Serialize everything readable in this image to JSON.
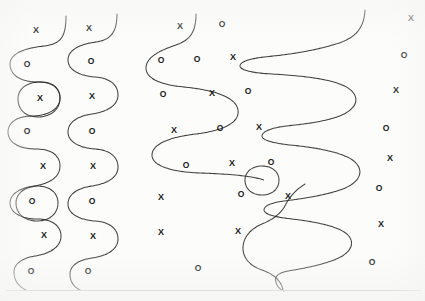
{
  "page": {
    "width": 425,
    "height": 301,
    "background_color": "#fcfcfb",
    "ink_color": "#2b2b2b",
    "marker_color": "#1a1a1a"
  },
  "footer_rule": {
    "label": "horizontal rule",
    "color": "#c9c9c9",
    "x": 6,
    "y": 290,
    "width": 415
  },
  "curves": [
    {
      "name": "left-serpentine",
      "description": "Tall vertical serpentine with rounded lobes along the left margin",
      "path": "M 66 16 C 66 38, 60 44, 44 46 C 24 48, 10 54, 10 64 C 10 76, 22 82, 38 82 C 52 82, 60 88, 60 98 C 60 110, 46 116, 32 116 C 18 116, 8 122, 8 132 C 8 143, 20 149, 36 149 C 52 149, 60 156, 60 166 C 60 178, 48 184, 34 186 C 20 188, 10 194, 10 203 C 10 213, 22 219, 37 219 C 52 219, 61 226, 61 236 C 61 248, 48 254, 35 256 C 22 258, 14 264, 14 272 C 14 280, 18 286, 26 290"
    },
    {
      "name": "left-loop-upper",
      "description": "Closed circular loop enclosing an X near the upper left",
      "path": "M 38 82 C 52 81, 60 88, 60 98 C 60 110, 50 117, 38 117 C 26 117, 18 110, 18 99 C 18 89, 26 83, 38 82 Z"
    },
    {
      "name": "left-loop-lower",
      "description": "Closed circular loop enclosing an O in the lower left",
      "path": "M 37 186 C 50 186, 58 193, 58 203 C 58 214, 49 221, 37 221 C 25 221, 16 214, 16 203 C 16 193, 25 187, 37 186 Z"
    },
    {
      "name": "second-serpentine",
      "description": "Second vertical serpentine wave, smoother, left-of-center",
      "path": "M 117 14 C 117 33, 110 40, 96 42 C 80 44, 68 50, 68 60 C 68 70, 80 76, 95 77 C 110 78, 118 85, 118 95 C 118 106, 106 112, 92 114 C 78 116, 68 122, 68 132 C 68 142, 80 148, 95 149 C 110 150, 118 157, 118 167 C 118 178, 106 184, 92 186 C 78 188, 68 194, 68 204 C 68 214, 80 220, 95 221 C 110 222, 118 229, 118 239 C 118 250, 106 256, 92 258 C 78 260, 70 266, 70 274 C 70 282, 74 287, 80 290"
    },
    {
      "name": "center-serpentine",
      "description": "Wide central serpentine sweeping right then left across the middle column",
      "path": "M 196 14 C 196 32, 190 40, 176 45 C 158 51, 146 58, 146 68 C 146 79, 162 85, 184 87 C 214 90, 236 97, 238 110 C 240 124, 220 131, 196 134 C 170 137, 152 144, 152 155 C 152 166, 172 172, 200 173 C 230 174, 252 176, 264 180"
    },
    {
      "name": "center-lower-wave",
      "description": "Short S-wave in the lower middle-right area",
      "path": "M 305 184 C 297 189, 290 196, 286 204 C 281 214, 272 220, 262 224 C 250 229, 243 238, 243 248 C 243 258, 250 266, 262 270 C 273 274, 281 280, 283 290"
    },
    {
      "name": "right-long-serpentine",
      "description": "Large horizontal serpentine snaking left and right down the right half of the page",
      "path": "M 365 10 C 364 28, 356 38, 336 44 C 310 52, 284 55, 264 57 C 248 59, 240 62, 240 66 C 240 70, 252 73, 272 74 C 308 76, 336 80, 348 88 C 360 96, 358 107, 344 114 C 330 121, 306 124, 286 126 C 270 128, 262 132, 262 136 C 262 140, 272 143, 290 145 C 322 148, 348 154, 356 163 C 365 173, 358 184, 340 190 C 322 196, 300 199, 284 201 C 270 203, 264 206, 264 210 C 264 214, 274 217, 292 219 C 318 222, 340 227, 348 235 C 356 244, 350 254, 334 260 C 318 266, 300 269, 288 271 C 278 273, 274 277, 276 282 C 277 287, 280 289, 284 291"
    },
    {
      "name": "right-small-loop",
      "description": "Small closed loop enclosing an O at the left of the lower right region",
      "path": "M 262 166 C 272 166, 279 172, 279 180 C 279 189, 272 195, 262 195 C 252 195, 245 189, 245 180 C 245 172, 252 166, 262 166 Z"
    }
  ],
  "markers": [
    {
      "symbol": "X",
      "x": 36,
      "y": 30,
      "group": "left-column"
    },
    {
      "symbol": "O",
      "x": 27,
      "y": 64,
      "group": "left-column"
    },
    {
      "symbol": "X",
      "x": 40,
      "y": 98,
      "group": "left-column"
    },
    {
      "symbol": "O",
      "x": 27,
      "y": 131,
      "group": "left-column"
    },
    {
      "symbol": "X",
      "x": 43,
      "y": 166,
      "group": "left-column"
    },
    {
      "symbol": "O",
      "x": 32,
      "y": 201,
      "group": "left-column"
    },
    {
      "symbol": "X",
      "x": 44,
      "y": 235,
      "group": "left-column"
    },
    {
      "symbol": "O",
      "x": 31,
      "y": 271,
      "group": "left-column"
    },
    {
      "symbol": "X",
      "x": 89,
      "y": 28,
      "group": "second-column"
    },
    {
      "symbol": "O",
      "x": 91,
      "y": 61,
      "group": "second-column"
    },
    {
      "symbol": "X",
      "x": 92,
      "y": 96,
      "group": "second-column"
    },
    {
      "symbol": "O",
      "x": 92,
      "y": 131,
      "group": "second-column"
    },
    {
      "symbol": "X",
      "x": 93,
      "y": 166,
      "group": "second-column"
    },
    {
      "symbol": "O",
      "x": 92,
      "y": 201,
      "group": "second-column"
    },
    {
      "symbol": "X",
      "x": 93,
      "y": 236,
      "group": "second-column"
    },
    {
      "symbol": "O",
      "x": 88,
      "y": 271,
      "group": "second-column"
    },
    {
      "symbol": "X",
      "x": 180,
      "y": 26,
      "group": "center-field"
    },
    {
      "symbol": "O",
      "x": 222,
      "y": 24,
      "group": "center-field"
    },
    {
      "symbol": "O",
      "x": 161,
      "y": 60,
      "group": "center-field"
    },
    {
      "symbol": "O",
      "x": 197,
      "y": 59,
      "group": "center-field"
    },
    {
      "symbol": "X",
      "x": 233,
      "y": 57,
      "group": "center-field"
    },
    {
      "symbol": "O",
      "x": 163,
      "y": 94,
      "group": "center-field"
    },
    {
      "symbol": "X",
      "x": 212,
      "y": 93,
      "group": "center-field"
    },
    {
      "symbol": "O",
      "x": 248,
      "y": 91,
      "group": "center-field"
    },
    {
      "symbol": "X",
      "x": 174,
      "y": 130,
      "group": "center-field"
    },
    {
      "symbol": "O",
      "x": 220,
      "y": 128,
      "group": "center-field"
    },
    {
      "symbol": "X",
      "x": 259,
      "y": 127,
      "group": "center-field"
    },
    {
      "symbol": "O",
      "x": 186,
      "y": 165,
      "group": "center-field"
    },
    {
      "symbol": "X",
      "x": 232,
      "y": 163,
      "group": "center-field"
    },
    {
      "symbol": "O",
      "x": 271,
      "y": 162,
      "group": "center-field"
    },
    {
      "symbol": "X",
      "x": 161,
      "y": 197,
      "group": "center-field"
    },
    {
      "symbol": "O",
      "x": 241,
      "y": 194,
      "group": "center-field"
    },
    {
      "symbol": "X",
      "x": 288,
      "y": 196,
      "group": "center-field"
    },
    {
      "symbol": "X",
      "x": 161,
      "y": 232,
      "group": "center-field"
    },
    {
      "symbol": "X",
      "x": 238,
      "y": 231,
      "group": "center-field"
    },
    {
      "symbol": "O",
      "x": 198,
      "y": 268,
      "group": "center-field"
    },
    {
      "symbol": "X",
      "x": 411,
      "y": 18,
      "group": "right-column"
    },
    {
      "symbol": "O",
      "x": 404,
      "y": 55,
      "group": "right-column"
    },
    {
      "symbol": "X",
      "x": 396,
      "y": 90,
      "group": "right-column"
    },
    {
      "symbol": "O",
      "x": 386,
      "y": 128,
      "group": "right-column"
    },
    {
      "symbol": "X",
      "x": 390,
      "y": 158,
      "group": "right-column"
    },
    {
      "symbol": "O",
      "x": 379,
      "y": 188,
      "group": "right-column"
    },
    {
      "symbol": "X",
      "x": 381,
      "y": 224,
      "group": "right-column"
    },
    {
      "symbol": "O",
      "x": 372,
      "y": 262,
      "group": "right-column"
    }
  ]
}
